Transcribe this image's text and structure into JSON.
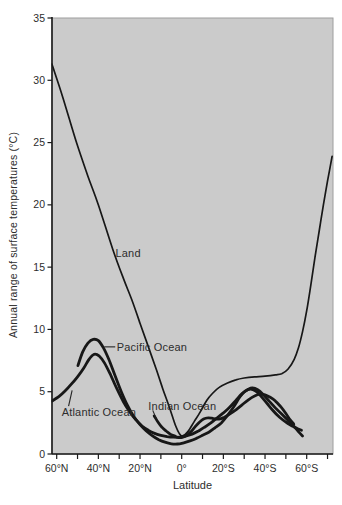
{
  "chart_data": {
    "type": "line",
    "title": "",
    "xlabel": "Latitude",
    "ylabel": "Annual range of surface temperatures (°C)",
    "x_axis": {
      "unit": "degrees latitude",
      "orientation": "60°N at left, ~75°S at right",
      "minor_tick_values": [
        60,
        50,
        40,
        30,
        20,
        10,
        0,
        -10,
        -20,
        -30,
        -40,
        -50,
        -60,
        -70
      ],
      "labeled_ticks": [
        {
          "value": 60,
          "label": "60°N"
        },
        {
          "value": 40,
          "label": "40°N"
        },
        {
          "value": 20,
          "label": "20°N"
        },
        {
          "value": 0,
          "label": "0°"
        },
        {
          "value": -20,
          "label": "20°S"
        },
        {
          "value": -40,
          "label": "40°S"
        },
        {
          "value": -60,
          "label": "60°S"
        }
      ],
      "domain": [
        62.5,
        -73
      ]
    },
    "y_axis": {
      "unit": "°C",
      "ylim": [
        0,
        35
      ],
      "ticks": [
        {
          "value": 0,
          "label": "0"
        },
        {
          "value": 5,
          "label": "5"
        },
        {
          "value": 10,
          "label": "10"
        },
        {
          "value": 15,
          "label": "15"
        },
        {
          "value": 20,
          "label": "20"
        },
        {
          "value": 25,
          "label": "25"
        },
        {
          "value": 30,
          "label": "30"
        },
        {
          "value": 35,
          "label": "35"
        }
      ]
    },
    "grid": false,
    "legend": "inline annotations with leader lines",
    "colors": {
      "panel_background": "#cbcbcb",
      "line": "#171717",
      "axis": "#1a1a1a",
      "frame": "#9e9e9e",
      "text": "#2d2d2d"
    },
    "series": [
      {
        "name": "Land",
        "stroke_width": 1.7,
        "points": [
          [
            62.3,
            31.3
          ],
          [
            57,
            28.6
          ],
          [
            50.5,
            25
          ],
          [
            45,
            22.3
          ],
          [
            40,
            20
          ],
          [
            33,
            16.4
          ],
          [
            28,
            14.1
          ],
          [
            24,
            12.4
          ],
          [
            20,
            10.5
          ],
          [
            16,
            8.6
          ],
          [
            12,
            6.7
          ],
          [
            9,
            5.2
          ],
          [
            6,
            3.8
          ],
          [
            3,
            2.3
          ],
          [
            1,
            1.6
          ],
          [
            -0.5,
            1.45
          ],
          [
            -3,
            1.8
          ],
          [
            -6,
            2.6
          ],
          [
            -9,
            3.4
          ],
          [
            -12,
            4.3
          ],
          [
            -15,
            4.9
          ],
          [
            -18,
            5.35
          ],
          [
            -22,
            5.7
          ],
          [
            -26,
            5.95
          ],
          [
            -30,
            6.1
          ],
          [
            -35,
            6.2
          ],
          [
            -40,
            6.25
          ],
          [
            -45,
            6.35
          ],
          [
            -48,
            6.45
          ],
          [
            -51,
            6.8
          ],
          [
            -54,
            7.6
          ],
          [
            -56,
            8.5
          ],
          [
            -58,
            9.8
          ],
          [
            -60,
            11.5
          ],
          [
            -62,
            13.6
          ],
          [
            -64,
            15.8
          ],
          [
            -66,
            17.9
          ],
          [
            -68,
            20
          ],
          [
            -70,
            21.9
          ],
          [
            -72.2,
            23.9
          ]
        ]
      },
      {
        "name": "Pacific Ocean",
        "stroke_width": 2.8,
        "points": [
          [
            49.8,
            7.1
          ],
          [
            47.5,
            8.2
          ],
          [
            45,
            8.9
          ],
          [
            42.5,
            9.2
          ],
          [
            40,
            9.1
          ],
          [
            37.5,
            8.5
          ],
          [
            35,
            7.6
          ],
          [
            32,
            6.3
          ],
          [
            29,
            5.0
          ],
          [
            26,
            3.9
          ],
          [
            23,
            3.0
          ],
          [
            20,
            2.35
          ],
          [
            17,
            1.85
          ],
          [
            14,
            1.45
          ],
          [
            11,
            1.15
          ],
          [
            8,
            0.95
          ],
          [
            5,
            0.82
          ],
          [
            2,
            0.8
          ],
          [
            -1,
            0.9
          ],
          [
            -4,
            1.05
          ],
          [
            -7,
            1.25
          ],
          [
            -10,
            1.5
          ],
          [
            -13,
            1.75
          ],
          [
            -16,
            2.1
          ],
          [
            -19,
            2.5
          ],
          [
            -22,
            3.1
          ],
          [
            -25,
            3.8
          ],
          [
            -28,
            4.6
          ],
          [
            -30.5,
            5.05
          ],
          [
            -33,
            5.2
          ],
          [
            -35.5,
            5.05
          ],
          [
            -38,
            4.65
          ],
          [
            -41,
            4.05
          ],
          [
            -44,
            3.45
          ],
          [
            -47,
            2.95
          ],
          [
            -50,
            2.55
          ],
          [
            -53,
            2.25
          ],
          [
            -55.5,
            2.05
          ],
          [
            -57.5,
            1.9
          ]
        ]
      },
      {
        "name": "Atlantic Ocean",
        "stroke_width": 2.8,
        "points": [
          [
            62.3,
            4.25
          ],
          [
            59,
            4.6
          ],
          [
            56,
            5.05
          ],
          [
            53,
            5.6
          ],
          [
            50,
            6.2
          ],
          [
            47,
            6.9
          ],
          [
            44.5,
            7.6
          ],
          [
            42,
            8.0
          ],
          [
            39.5,
            7.85
          ],
          [
            37,
            7.3
          ],
          [
            34,
            6.3
          ],
          [
            31,
            5.2
          ],
          [
            28,
            4.2
          ],
          [
            25,
            3.4
          ],
          [
            22,
            2.75
          ],
          [
            19,
            2.25
          ],
          [
            16,
            1.9
          ],
          [
            13,
            1.65
          ],
          [
            10,
            1.5
          ],
          [
            7,
            1.4
          ],
          [
            4,
            1.35
          ],
          [
            1,
            1.35
          ],
          [
            -2,
            1.45
          ],
          [
            -5,
            1.6
          ],
          [
            -8,
            1.85
          ],
          [
            -11,
            2.15
          ],
          [
            -14,
            2.5
          ],
          [
            -17,
            2.9
          ],
          [
            -20,
            3.3
          ],
          [
            -23,
            3.75
          ],
          [
            -26,
            4.3
          ],
          [
            -29,
            4.85
          ],
          [
            -32,
            5.2
          ],
          [
            -34,
            5.3
          ],
          [
            -36.5,
            5.15
          ],
          [
            -39,
            4.8
          ],
          [
            -42,
            4.25
          ],
          [
            -45,
            3.7
          ],
          [
            -48,
            3.2
          ],
          [
            -51,
            2.7
          ],
          [
            -54,
            2.2
          ],
          [
            -56,
            1.8
          ],
          [
            -58,
            1.45
          ]
        ]
      },
      {
        "name": "Indian Ocean",
        "stroke_width": 2.8,
        "points": [
          [
            13.2,
            3.05
          ],
          [
            11.5,
            2.6
          ],
          [
            9.5,
            2.15
          ],
          [
            7.5,
            1.85
          ],
          [
            5.5,
            1.6
          ],
          [
            3.5,
            1.45
          ],
          [
            1.5,
            1.32
          ],
          [
            -0.5,
            1.35
          ],
          [
            -2.5,
            1.5
          ],
          [
            -4.5,
            1.8
          ],
          [
            -6.5,
            2.2
          ],
          [
            -8.5,
            2.55
          ],
          [
            -10.5,
            2.8
          ],
          [
            -12.5,
            2.9
          ],
          [
            -14.5,
            2.87
          ],
          [
            -16.5,
            2.8
          ],
          [
            -18.5,
            2.82
          ],
          [
            -20.5,
            2.95
          ],
          [
            -23,
            3.2
          ],
          [
            -26,
            3.55
          ],
          [
            -29,
            3.95
          ],
          [
            -32,
            4.35
          ],
          [
            -35,
            4.65
          ],
          [
            -37.5,
            4.8
          ],
          [
            -40,
            4.75
          ],
          [
            -42.5,
            4.55
          ],
          [
            -45,
            4.25
          ],
          [
            -47.5,
            3.8
          ],
          [
            -50,
            3.25
          ],
          [
            -52,
            2.75
          ],
          [
            -53.8,
            2.4
          ]
        ]
      }
    ],
    "annotations": [
      {
        "text": "Land",
        "lat": 31.8,
        "temp": 16.1,
        "leader": null
      },
      {
        "text": "Pacific Ocean",
        "lat": 31.2,
        "temp": 8.6,
        "leader": [
          [
            37.2,
            8.6
          ],
          [
            31.9,
            8.6
          ]
        ]
      },
      {
        "text": "Atlantic Ocean",
        "lat": 57.6,
        "temp": 3.4,
        "leader": [
          [
            54.3,
            3.85
          ],
          [
            52.6,
            5.1
          ]
        ]
      },
      {
        "text": "Indian Ocean",
        "lat": 16.0,
        "temp": 3.85,
        "leader": [
          [
            13.9,
            3.5
          ],
          [
            12.2,
            2.85
          ]
        ]
      }
    ]
  }
}
